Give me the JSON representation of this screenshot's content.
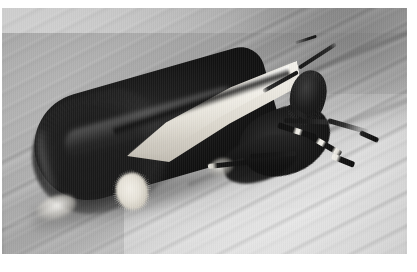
{
  "image": {
    "kind": "photograph",
    "subject": "moth",
    "palette": "black-and-white",
    "caption": "",
    "alt_text": "Black and white macro photograph of a moth resting on a striated surface"
  },
  "frame": {
    "page_background": "#ffffff",
    "plate_left": 2,
    "plate_top": 8,
    "plate_width": 405,
    "plate_height": 246
  },
  "background": {
    "name": "striated-surface",
    "description": "Out-of-focus plant stem or wooden surface with fine diagonal grain running from lower-left to upper-right",
    "light_tone": "#d9d9d9",
    "mid_tone": "#b0b0b0",
    "dark_tone": "#8f8f8f"
  },
  "subject": {
    "common_name": "moth",
    "pose": "resting in profile, head up and to the right, tail rounded at lower left",
    "parts": [
      {
        "name": "forewing-dark-field",
        "tone": "#141414",
        "note": "long dark tapered wing covering the body"
      },
      {
        "name": "forewing-pale-stripe",
        "tone": "#ece9e1",
        "note": "broad cream costal band along the upper wing margin"
      },
      {
        "name": "forewing-pale-spot",
        "tone": "#f0ede5",
        "note": "rounded pale spot on the dark lower wing area"
      },
      {
        "name": "tail-tuft",
        "tone": "#1a1a1a",
        "note": "fuzzy rounded scale tuft at the rear"
      },
      {
        "name": "tail-highlight",
        "tone": "#faf9f5",
        "note": "bright rim highlight at the lower-left of the tail"
      },
      {
        "name": "thorax",
        "tone": "#1c1c1c"
      },
      {
        "name": "head",
        "tone": "#141414"
      },
      {
        "name": "antennae",
        "tone": "#161616",
        "count": 2,
        "note": "two slender antennae spread in a V"
      },
      {
        "name": "legs",
        "tone": "#111111",
        "note": "banded black and white legs extended forward"
      }
    ]
  },
  "colors": {
    "white": "#ffffff",
    "black": "#0b0b0b",
    "cream": "#ece9e1",
    "background_mid": "#b0b0b0"
  }
}
